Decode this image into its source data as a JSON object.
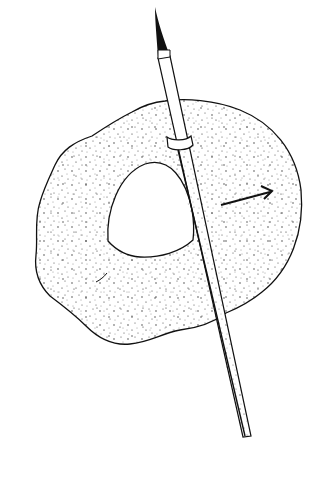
{
  "image": {
    "title": "Brush over dough with dome-shaped cutout",
    "description": "Black ink line drawing: a stippled irregular round sheet (dough) with a dome-shaped hole, a paintbrush lying diagonally across it, and an arrow pointing right",
    "colors": {
      "background": "#ffffff",
      "ink": "#111111",
      "stipple": "#2a2a2a"
    },
    "elements": {
      "sheet": "stippled-irregular-round-sheet",
      "hole": "dome-shaped-cutout",
      "brush": "fine-pointed-paintbrush",
      "arrow": "right-pointing-arrow"
    }
  }
}
